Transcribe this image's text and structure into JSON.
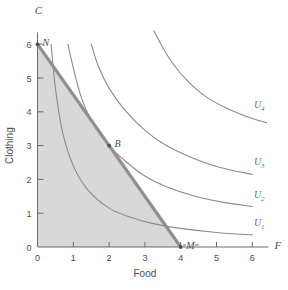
{
  "chart_data": {
    "type": "line",
    "title": "",
    "xlabel": "Food",
    "ylabel": "Clothing",
    "xlim": [
      0,
      6.4
    ],
    "ylim": [
      0,
      6.4
    ],
    "xticks": [
      "0",
      "1",
      "2",
      "3",
      "4",
      "5",
      "6"
    ],
    "yticks": [
      "1",
      "2",
      "3",
      "4",
      "5",
      "6"
    ],
    "xtick_values": [
      0,
      1,
      2,
      3,
      4,
      5,
      6
    ],
    "ytick_values": [
      1,
      2,
      3,
      4,
      5,
      6
    ],
    "grid": false,
    "legend_position": "inline-right",
    "axis_letters": {
      "vertical": "C",
      "horizontal": "F"
    },
    "budget_line": {
      "name": "budget line",
      "from": {
        "x": 0,
        "y": 6
      },
      "to": {
        "x": 4,
        "y": 0
      },
      "slope": -1.5,
      "color": "#8f8f8f"
    },
    "feasible_region": {
      "name": "budget set",
      "shaded": true,
      "color": "#d8d8d8",
      "vertices": [
        {
          "x": 0,
          "y": 0
        },
        {
          "x": 0,
          "y": 6
        },
        {
          "x": 4,
          "y": 0
        }
      ]
    },
    "points": [
      {
        "label": "N",
        "x": 0,
        "y": 6,
        "description": "vertical intercept"
      },
      {
        "label": "B",
        "x": 2,
        "y": 3,
        "description": "optimal bundle, tangency point"
      },
      {
        "label": "M",
        "x": 4,
        "y": 0,
        "description": "horizontal intercept"
      }
    ],
    "series": [
      {
        "name": "U1",
        "label": "U",
        "subscript": "1",
        "utility_constant": 2.1,
        "points": [
          {
            "x": 0.38,
            "y": 6.0
          },
          {
            "x": 0.5,
            "y": 4.7
          },
          {
            "x": 0.7,
            "y": 3.4
          },
          {
            "x": 1.0,
            "y": 2.4
          },
          {
            "x": 1.4,
            "y": 1.7
          },
          {
            "x": 2.0,
            "y": 1.15
          },
          {
            "x": 2.6,
            "y": 0.88
          },
          {
            "x": 3.2,
            "y": 0.7
          },
          {
            "x": 4.0,
            "y": 0.55
          },
          {
            "x": 5.0,
            "y": 0.43
          },
          {
            "x": 6.0,
            "y": 0.36
          }
        ],
        "label_position": {
          "x": 6.05,
          "y": 0.62
        }
      },
      {
        "name": "U2",
        "label": "U",
        "subscript": "2",
        "utility_constant": 6.0,
        "tangent_at": {
          "x": 2,
          "y": 3
        },
        "points": [
          {
            "x": 0.85,
            "y": 6.0
          },
          {
            "x": 1.0,
            "y": 5.3
          },
          {
            "x": 1.2,
            "y": 4.5
          },
          {
            "x": 1.5,
            "y": 3.75
          },
          {
            "x": 2.0,
            "y": 3.0
          },
          {
            "x": 2.5,
            "y": 2.5
          },
          {
            "x": 3.0,
            "y": 2.1
          },
          {
            "x": 3.6,
            "y": 1.78
          },
          {
            "x": 4.4,
            "y": 1.5
          },
          {
            "x": 5.2,
            "y": 1.32
          },
          {
            "x": 6.0,
            "y": 1.2
          }
        ],
        "label_position": {
          "x": 6.05,
          "y": 1.45
        }
      },
      {
        "name": "U3",
        "label": "U",
        "subscript": "3",
        "utility_constant": 10.5,
        "points": [
          {
            "x": 1.5,
            "y": 6.0
          },
          {
            "x": 1.7,
            "y": 5.35
          },
          {
            "x": 2.0,
            "y": 4.7
          },
          {
            "x": 2.4,
            "y": 4.1
          },
          {
            "x": 3.0,
            "y": 3.45
          },
          {
            "x": 3.6,
            "y": 3.0
          },
          {
            "x": 4.3,
            "y": 2.65
          },
          {
            "x": 5.1,
            "y": 2.35
          },
          {
            "x": 6.0,
            "y": 2.15
          }
        ],
        "label_position": {
          "x": 6.05,
          "y": 2.42
        }
      },
      {
        "name": "U4",
        "label": "U",
        "subscript": "4",
        "utility_constant": 21.0,
        "points": [
          {
            "x": 3.25,
            "y": 6.4
          },
          {
            "x": 3.5,
            "y": 5.9
          },
          {
            "x": 3.8,
            "y": 5.4
          },
          {
            "x": 4.2,
            "y": 4.9
          },
          {
            "x": 4.7,
            "y": 4.45
          },
          {
            "x": 5.3,
            "y": 4.1
          },
          {
            "x": 6.0,
            "y": 3.8
          },
          {
            "x": 6.4,
            "y": 3.68
          }
        ],
        "label_position": {
          "x": 6.05,
          "y": 4.1
        }
      }
    ]
  }
}
